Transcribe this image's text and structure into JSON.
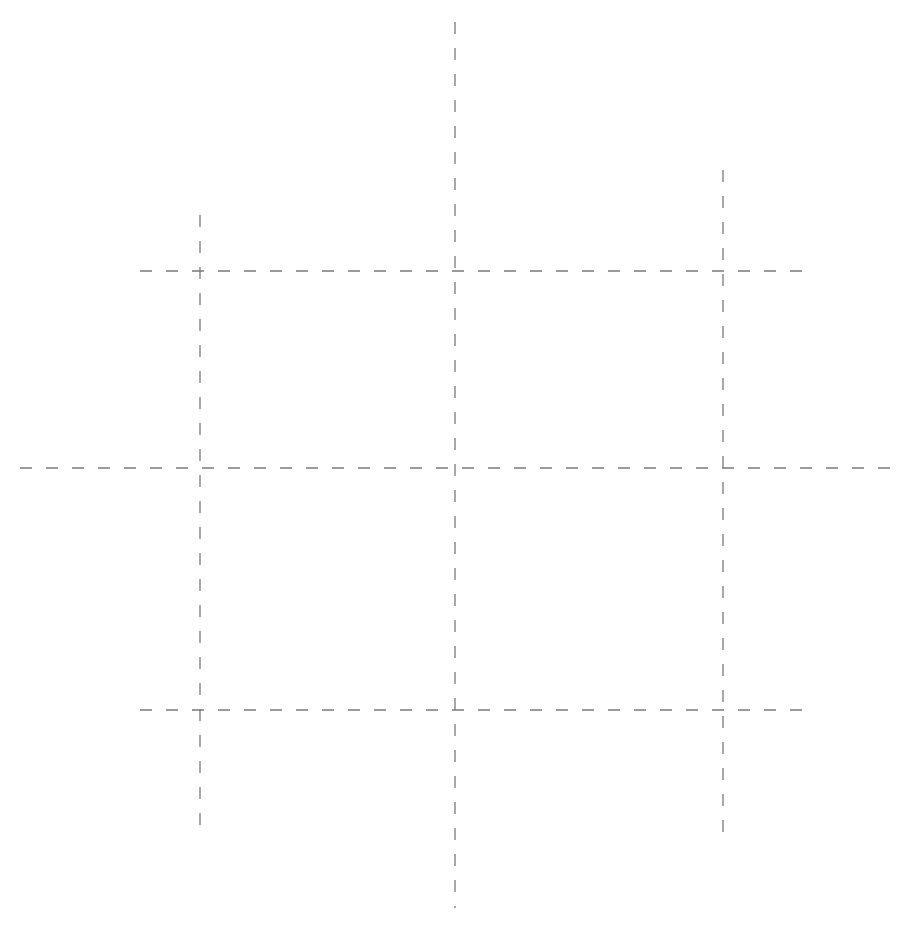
{
  "canvas": {
    "width": 914,
    "height": 926,
    "background": "#ffffff"
  },
  "style": {
    "stroke": "#7a7a7a",
    "stroke_width": 1.3,
    "dash": "12 14"
  },
  "lines": [
    {
      "name": "vertical-line-left",
      "x1": 200,
      "y1": 215,
      "x2": 200,
      "y2": 825
    },
    {
      "name": "vertical-line-center",
      "x1": 455,
      "y1": 22,
      "x2": 455,
      "y2": 908
    },
    {
      "name": "vertical-line-right",
      "x1": 723,
      "y1": 170,
      "x2": 723,
      "y2": 835
    },
    {
      "name": "horizontal-line-top",
      "x1": 140,
      "y1": 271,
      "x2": 808,
      "y2": 271
    },
    {
      "name": "horizontal-line-middle",
      "x1": 20,
      "y1": 468,
      "x2": 896,
      "y2": 468
    },
    {
      "name": "horizontal-line-bottom",
      "x1": 140,
      "y1": 710,
      "x2": 808,
      "y2": 710
    }
  ]
}
